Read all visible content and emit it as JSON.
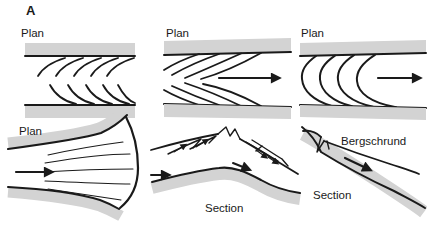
{
  "figure": {
    "label": "A",
    "colors": {
      "line": "#1a1a1a",
      "band": "#d3d3d3",
      "background": "#ffffff"
    },
    "panels": {
      "top_left": {
        "view": "Plan"
      },
      "top_middle": {
        "view": "Plan"
      },
      "top_right": {
        "view": "Plan"
      },
      "bottom_left": {
        "view": "Plan"
      },
      "bottom_middle": {
        "view": "Section"
      },
      "bottom_right": {
        "view": "Section",
        "feature": "Bergschrund"
      }
    }
  }
}
